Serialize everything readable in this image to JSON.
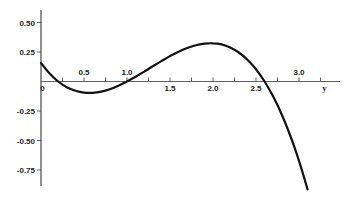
{
  "figure": {
    "background_color": "#ffffff",
    "curve_color": "#121212",
    "axis_color": "#606060",
    "label_color": "#262626"
  },
  "chart_data": {
    "type": "line",
    "title": "",
    "xlabel": "y",
    "ylabel": "",
    "xlim": [
      0,
      3.48
    ],
    "ylim": [
      -0.99,
      0.61
    ],
    "grid": false,
    "legend": false,
    "x_axis": {
      "variable_label": "y",
      "origin_label": "0",
      "minor_tick_values": [
        0.25,
        0.5,
        0.75,
        1.0,
        1.25,
        1.5,
        1.75,
        2.0,
        2.25,
        2.5,
        2.75,
        3.0,
        3.25
      ],
      "labeled_ticks": [
        {
          "value": 0.5,
          "label": "0.5",
          "position": "above"
        },
        {
          "value": 1.0,
          "label": "1.0",
          "position": "above"
        },
        {
          "value": 1.5,
          "label": "1.5",
          "position": "below"
        },
        {
          "value": 2.0,
          "label": "2.0",
          "position": "below"
        },
        {
          "value": 2.5,
          "label": "2.5",
          "position": "below"
        },
        {
          "value": 3.0,
          "label": "3.0",
          "position": "above"
        }
      ]
    },
    "y_axis": {
      "labeled_ticks": [
        {
          "value": 0.5,
          "label": "0.50"
        },
        {
          "value": 0.25,
          "label": "0.25"
        },
        {
          "value": -0.25,
          "label": "-0.25"
        },
        {
          "value": -0.5,
          "label": "-0.50"
        },
        {
          "value": -0.75,
          "label": "-0.75"
        }
      ]
    },
    "series": [
      {
        "name": "f(y)",
        "points": [
          [
            0.0,
            0.156
          ],
          [
            0.1,
            0.068
          ],
          [
            0.2,
            0.0
          ],
          [
            0.3,
            -0.048
          ],
          [
            0.4,
            -0.079
          ],
          [
            0.5,
            -0.094
          ],
          [
            0.6,
            -0.096
          ],
          [
            0.7,
            -0.086
          ],
          [
            0.8,
            -0.065
          ],
          [
            0.9,
            -0.036
          ],
          [
            1.0,
            0.0
          ],
          [
            1.1,
            0.041
          ],
          [
            1.2,
            0.084
          ],
          [
            1.3,
            0.129
          ],
          [
            1.4,
            0.173
          ],
          [
            1.5,
            0.215
          ],
          [
            1.6,
            0.252
          ],
          [
            1.7,
            0.284
          ],
          [
            1.8,
            0.307
          ],
          [
            1.9,
            0.321
          ],
          [
            2.0,
            0.324
          ],
          [
            2.1,
            0.314
          ],
          [
            2.2,
            0.288
          ],
          [
            2.3,
            0.246
          ],
          [
            2.4,
            0.185
          ],
          [
            2.5,
            0.104
          ],
          [
            2.6,
            0.0
          ],
          [
            2.7,
            -0.128
          ],
          [
            2.8,
            -0.281
          ],
          [
            2.9,
            -0.462
          ],
          [
            3.0,
            -0.672
          ],
          [
            3.1,
            -0.914
          ]
        ]
      }
    ],
    "features": {
      "zero_crossings": [
        0.2,
        1.0,
        2.6
      ],
      "local_min": {
        "x": 0.55,
        "value": -0.1
      },
      "local_max": {
        "x": 2.0,
        "value": 0.32
      }
    }
  }
}
